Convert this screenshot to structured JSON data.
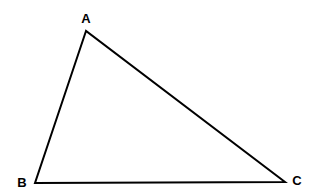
{
  "diagram": {
    "type": "triangle",
    "stroke_color": "#000000",
    "background": "#ffffff",
    "vertices": [
      {
        "label": "A",
        "x": 86,
        "y": 31,
        "label_x": 86,
        "label_y": 23
      },
      {
        "label": "B",
        "x": 35,
        "y": 183,
        "label_x": 22,
        "label_y": 186
      },
      {
        "label": "C",
        "x": 285,
        "y": 182,
        "label_x": 297,
        "label_y": 184
      }
    ],
    "edges": [
      [
        "A",
        "B"
      ],
      [
        "B",
        "C"
      ],
      [
        "C",
        "A"
      ]
    ]
  }
}
